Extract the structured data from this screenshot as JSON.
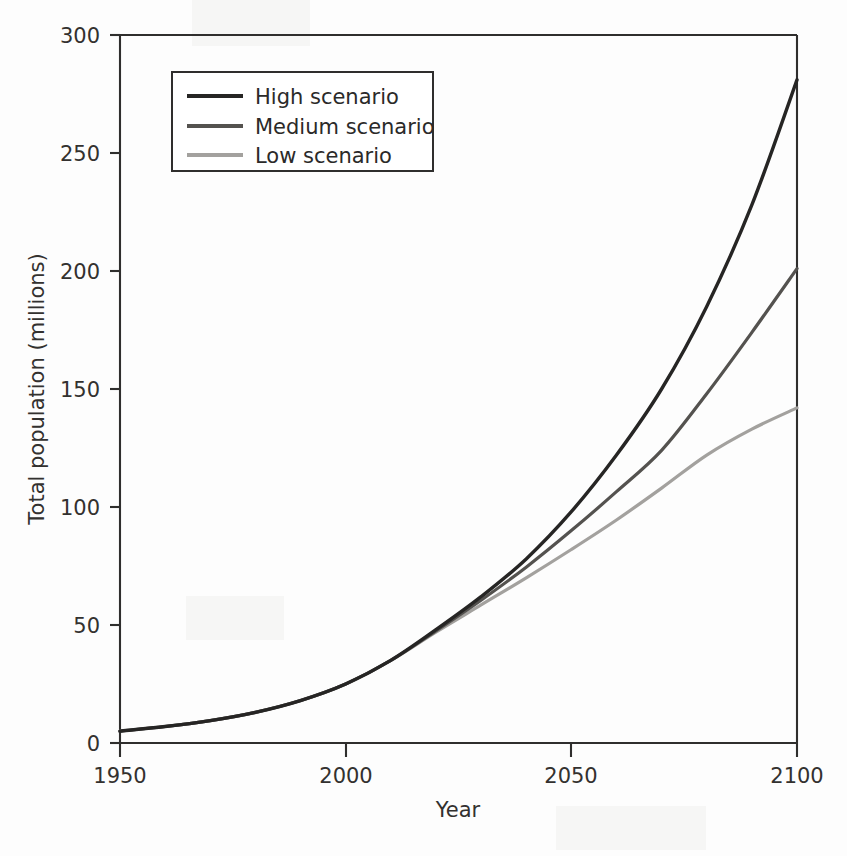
{
  "figure": {
    "background_color": "#fdfdfd",
    "axis_color": "#2f2e2d"
  },
  "chart_data": {
    "type": "line",
    "title": "",
    "subtitle": "",
    "xlabel": "Year",
    "ylabel": "Total population (millions)",
    "xlim": [
      1950,
      2100
    ],
    "ylim": [
      0,
      300
    ],
    "xticks": [
      "1950",
      "2000",
      "2050",
      "2100"
    ],
    "xtick_values": [
      1950,
      2000,
      2050,
      2100
    ],
    "yticks": [
      "0",
      "50",
      "100",
      "150",
      "200",
      "250",
      "300"
    ],
    "ytick_values": [
      0,
      50,
      100,
      150,
      200,
      250,
      300
    ],
    "grid": false,
    "legend_position": "upper left",
    "x": [
      1950,
      1960,
      1970,
      1980,
      1990,
      2000,
      2010,
      2020,
      2030,
      2040,
      2050,
      2060,
      2070,
      2080,
      2090,
      2100
    ],
    "series": [
      {
        "name": "High scenario",
        "color": "#262524",
        "linewidth": 3.4,
        "values": [
          5.0,
          7.0,
          9.5,
          13.0,
          18.0,
          25.0,
          35.0,
          48.0,
          62.0,
          78.0,
          98.0,
          122.0,
          150.0,
          185.0,
          228.0,
          281.0
        ]
      },
      {
        "name": "Medium scenario",
        "color": "#54524f",
        "linewidth": 3.2,
        "values": [
          5.0,
          7.0,
          9.5,
          13.0,
          18.0,
          25.0,
          35.0,
          47.5,
          60.5,
          74.5,
          90.0,
          106.5,
          124.0,
          148.0,
          174.0,
          201.0
        ]
      },
      {
        "name": "Low scenario",
        "color": "#a3a19e",
        "linewidth": 3.2,
        "values": [
          5.0,
          7.0,
          9.5,
          13.0,
          18.0,
          25.0,
          35.0,
          47.0,
          58.5,
          70.0,
          82.0,
          94.5,
          108.0,
          122.0,
          133.0,
          142.0
        ]
      }
    ],
    "annotations": []
  },
  "legend": {
    "items": [
      {
        "label": "High scenario",
        "color": "#262524"
      },
      {
        "label": "Medium scenario",
        "color": "#54524f"
      },
      {
        "label": "Low scenario",
        "color": "#a3a19e"
      }
    ]
  }
}
